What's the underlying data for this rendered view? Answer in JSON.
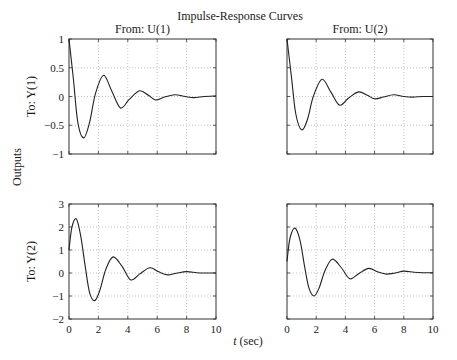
{
  "chart_data": {
    "type": "line",
    "title": "Impulse-Response Curves",
    "xlabel": "t (sec)",
    "xlabel_italic_part": "t",
    "xlabel_rest": " (sec)",
    "ylabel": "Outputs",
    "grid": true,
    "columns": [
      "From: U(1)",
      "From: U(2)"
    ],
    "rows": [
      "To: Y(1)",
      "To: Y(2)"
    ],
    "xlim": [
      0,
      10
    ],
    "xticks": [
      0,
      2,
      4,
      6,
      8,
      10
    ],
    "subplots": [
      {
        "row": 0,
        "col": 0,
        "title": "From: U(1)",
        "ylabel": "To: Y(1)",
        "ylim": [
          -1,
          1
        ],
        "yticks": [
          -1,
          -0.5,
          0,
          0.5,
          1
        ],
        "ytick_labels": [
          "−1",
          "−0.5",
          "0",
          "0.5",
          "1"
        ],
        "x": [
          0,
          0.3,
          0.6,
          1.0,
          1.4,
          1.8,
          2.35,
          2.9,
          3.5,
          4.1,
          4.8,
          5.4,
          5.9,
          6.5,
          7.2,
          7.9,
          8.5,
          9.2,
          10
        ],
        "y": [
          1,
          0.3,
          -0.45,
          -0.72,
          -0.45,
          0.05,
          0.37,
          0.1,
          -0.2,
          -0.05,
          0.1,
          0.02,
          -0.06,
          -0.01,
          0.03,
          0.0,
          -0.02,
          0.0,
          0.01
        ]
      },
      {
        "row": 0,
        "col": 1,
        "title": "From: U(2)",
        "ylabel": "",
        "ylim": [
          -1,
          1
        ],
        "yticks": [
          -1,
          -0.5,
          0,
          0.5,
          1
        ],
        "ytick_labels": [],
        "x": [
          0,
          0.3,
          0.6,
          1.0,
          1.4,
          1.8,
          2.4,
          3.0,
          3.6,
          4.2,
          4.9,
          5.5,
          6.0,
          6.6,
          7.3,
          8.0,
          8.6,
          9.3,
          10
        ],
        "y": [
          1,
          0.35,
          -0.3,
          -0.58,
          -0.4,
          0.0,
          0.3,
          0.08,
          -0.15,
          -0.03,
          0.08,
          0.02,
          -0.04,
          -0.01,
          0.03,
          0.0,
          -0.01,
          0.0,
          0.0
        ]
      },
      {
        "row": 1,
        "col": 0,
        "title": "",
        "ylabel": "To: Y(2)",
        "ylim": [
          -2,
          3
        ],
        "yticks": [
          -2,
          -1,
          0,
          1,
          2,
          3
        ],
        "ytick_labels": [
          "−2",
          "−1",
          "0",
          "1",
          "2",
          "3"
        ],
        "x": [
          0,
          0.2,
          0.5,
          0.8,
          1.1,
          1.4,
          1.75,
          2.1,
          2.5,
          3.0,
          3.6,
          4.2,
          4.8,
          5.5,
          6.1,
          6.7,
          7.3,
          8.0,
          8.7,
          9.3,
          10
        ],
        "y": [
          1.0,
          2.0,
          2.35,
          1.6,
          0.3,
          -0.85,
          -1.2,
          -0.75,
          0.15,
          0.7,
          0.3,
          -0.3,
          -0.05,
          0.23,
          0.05,
          -0.08,
          -0.01,
          0.06,
          0.01,
          0.0,
          0.0
        ]
      },
      {
        "row": 1,
        "col": 1,
        "title": "",
        "ylabel": "",
        "ylim": [
          -2,
          3
        ],
        "yticks": [
          -2,
          -1,
          0,
          1,
          2,
          3
        ],
        "ytick_labels": [],
        "x": [
          0,
          0.2,
          0.55,
          0.9,
          1.2,
          1.5,
          1.85,
          2.2,
          2.6,
          3.1,
          3.7,
          4.3,
          4.9,
          5.6,
          6.2,
          6.8,
          7.4,
          8.0,
          8.7,
          9.3,
          10
        ],
        "y": [
          0.5,
          1.5,
          1.95,
          1.4,
          0.3,
          -0.65,
          -1.0,
          -0.65,
          0.1,
          0.6,
          0.25,
          -0.25,
          -0.03,
          0.2,
          0.05,
          -0.05,
          0.0,
          0.08,
          0.03,
          0.01,
          0.01
        ]
      }
    ]
  }
}
